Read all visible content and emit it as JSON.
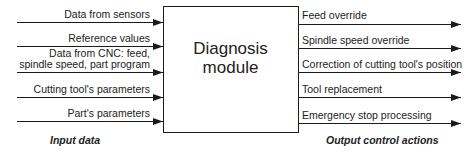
{
  "diagram": {
    "module": {
      "title_line1": "Diagnosis",
      "title_line2": "module"
    },
    "inputs": [
      {
        "lines": [
          "Data from sensors"
        ]
      },
      {
        "lines": [
          "Reference values"
        ]
      },
      {
        "lines": [
          "Data from CNC: feed,",
          "spindle speed, part program"
        ]
      },
      {
        "lines": [
          "Cutting tool's parameters"
        ]
      },
      {
        "lines": [
          "Part's parameters"
        ]
      }
    ],
    "outputs": [
      {
        "label": "Feed override"
      },
      {
        "label": "Spindle speed override"
      },
      {
        "label": "Correction of cutting tool's position"
      },
      {
        "label": "Tool replacement"
      },
      {
        "label": "Emergency stop processing"
      }
    ],
    "captions": {
      "inputs": "Input data",
      "outputs": "Output control actions"
    },
    "colors": {
      "line": "#1a1a1a",
      "background": "#ffffff"
    }
  }
}
